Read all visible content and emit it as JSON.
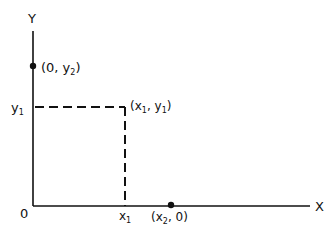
{
  "diagram": {
    "axes": {
      "x_label": "X",
      "y_label": "Y",
      "origin_label": "0"
    },
    "points": [
      {
        "name": "point-0-y2",
        "label_prefix": "(0, y",
        "label_sub": "2",
        "label_suffix": ")"
      },
      {
        "name": "point-x1-y1",
        "label_prefix": "(x",
        "label_sub1": "1",
        "label_mid": ", y",
        "label_sub2": "1",
        "label_suffix": ")"
      },
      {
        "name": "point-x2-0",
        "label_prefix": "(x",
        "label_sub": "2",
        "label_suffix": ", 0)"
      }
    ],
    "ticks": {
      "y1_main": "y",
      "y1_sub": "1",
      "x1_main": "x",
      "x1_sub": "1"
    },
    "colors": {
      "stroke": "#111111",
      "background": "#ffffff"
    }
  }
}
